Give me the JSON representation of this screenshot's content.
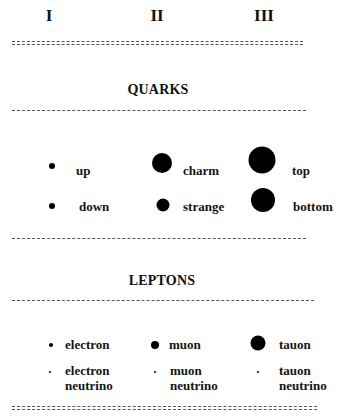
{
  "generations": [
    {
      "label": "I",
      "x": 49
    },
    {
      "label": "II",
      "x": 157
    },
    {
      "label": "III",
      "x": 264
    }
  ],
  "sections": {
    "quarks": {
      "title": "QUARKS",
      "particles": [
        {
          "name": "up",
          "generation": "I",
          "dot_diameter": 6
        },
        {
          "name": "charm",
          "generation": "II",
          "dot_diameter": 20
        },
        {
          "name": "top",
          "generation": "III",
          "dot_diameter": 27
        },
        {
          "name": "down",
          "generation": "I",
          "dot_diameter": 6
        },
        {
          "name": "strange",
          "generation": "II",
          "dot_diameter": 13
        },
        {
          "name": "bottom",
          "generation": "III",
          "dot_diameter": 24
        }
      ]
    },
    "leptons": {
      "title": "LEPTONS",
      "particles": [
        {
          "name": "electron",
          "generation": "I",
          "dot_diameter": 4
        },
        {
          "name": "muon",
          "generation": "II",
          "dot_diameter": 8
        },
        {
          "name": "tauon",
          "generation": "III",
          "dot_diameter": 15
        },
        {
          "name": "electron\nneutrino",
          "generation": "I",
          "dot_diameter": 2
        },
        {
          "name": "muon\nneutrino",
          "generation": "II",
          "dot_diameter": 2
        },
        {
          "name": "tauon\nneutrino",
          "generation": "III",
          "dot_diameter": 2
        }
      ]
    }
  },
  "colors": {
    "dot": "#000000",
    "text": "#141414",
    "rule": "#555555",
    "background": "#ffffff"
  }
}
